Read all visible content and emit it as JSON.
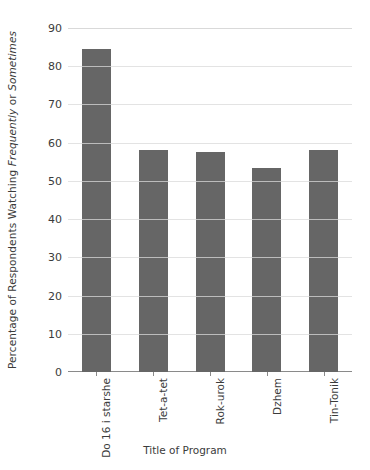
{
  "chart_data": {
    "type": "bar",
    "title": "",
    "categories": [
      "Do 16 i starshe",
      "Tet-a-tet",
      "Rok-urok",
      "Dzhem",
      "Tin-Tonik"
    ],
    "values": [
      84.5,
      58,
      57.5,
      53.5,
      58
    ],
    "xlabel": "Title of Program",
    "ylabel_parts": [
      {
        "text": "Percentage of Respondents Watching ",
        "italic": false
      },
      {
        "text": "Frequently",
        "italic": true
      },
      {
        "text": " or ",
        "italic": false
      },
      {
        "text": "Sometimes",
        "italic": true
      }
    ],
    "ylabel": "Percentage of Respondents Watching Frequently or Sometimes",
    "ylim": [
      0,
      90
    ],
    "yticks": [
      0,
      10,
      20,
      30,
      40,
      50,
      60,
      70,
      80,
      90
    ],
    "grid": true,
    "legend": null,
    "bar_color": "#666666",
    "gridline_color": "#d9d9d9",
    "axis_color": "#8a8a8a"
  }
}
